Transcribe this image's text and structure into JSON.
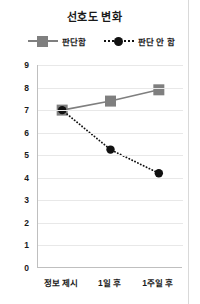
{
  "chart_data": {
    "type": "line",
    "title": "선호도 변화",
    "xlabel": "",
    "ylabel": "",
    "categories": [
      "정보 제시",
      "1일 후",
      "1주일 후"
    ],
    "series": [
      {
        "name": "판단함",
        "values": [
          7.0,
          7.4,
          7.9
        ],
        "color": "#7f7f7f",
        "marker": "square",
        "linestyle": "solid"
      },
      {
        "name": "판단 안 함",
        "values": [
          7.0,
          5.25,
          4.2
        ],
        "color": "#111111",
        "marker": "circle",
        "linestyle": "dotted"
      }
    ],
    "ylim": [
      0,
      9
    ],
    "yticks": [
      0,
      1,
      2,
      3,
      4,
      5,
      6,
      7,
      8,
      9
    ],
    "ytick_labels": [
      "0",
      "1",
      "2",
      "3",
      "4",
      "5",
      "6",
      "7",
      "8",
      "9"
    ],
    "grid": true,
    "legend_position": "top"
  },
  "legend": {
    "items": [
      {
        "label": "판단함"
      },
      {
        "label": "판단 안 함"
      }
    ]
  },
  "axes": {
    "y_labels": [
      "9",
      "8",
      "7",
      "6",
      "5",
      "4",
      "3",
      "2",
      "1",
      "0"
    ],
    "x_labels": [
      "정보 제시",
      "1일 후",
      "1주일 후"
    ]
  }
}
